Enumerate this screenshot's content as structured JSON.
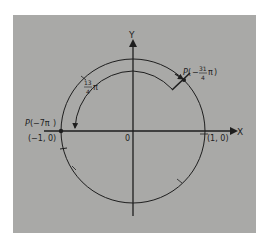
{
  "diagram": {
    "axes": {
      "x_label": "X",
      "y_label": "Y",
      "origin_label": "0"
    },
    "points": {
      "left": {
        "name": "P",
        "arg": "−7π",
        "coords": "(−1, 0)"
      },
      "right": {
        "coords": "(1, 0)"
      },
      "upper": {
        "name": "P",
        "sign": "−",
        "numerator": "31",
        "denominator": "4",
        "pi": "π"
      }
    },
    "arc_label": {
      "numerator": "13",
      "denominator": "4",
      "pi": "π"
    },
    "colors": {
      "background": "#a9a9a7",
      "ink": "#1e1e1e"
    }
  }
}
